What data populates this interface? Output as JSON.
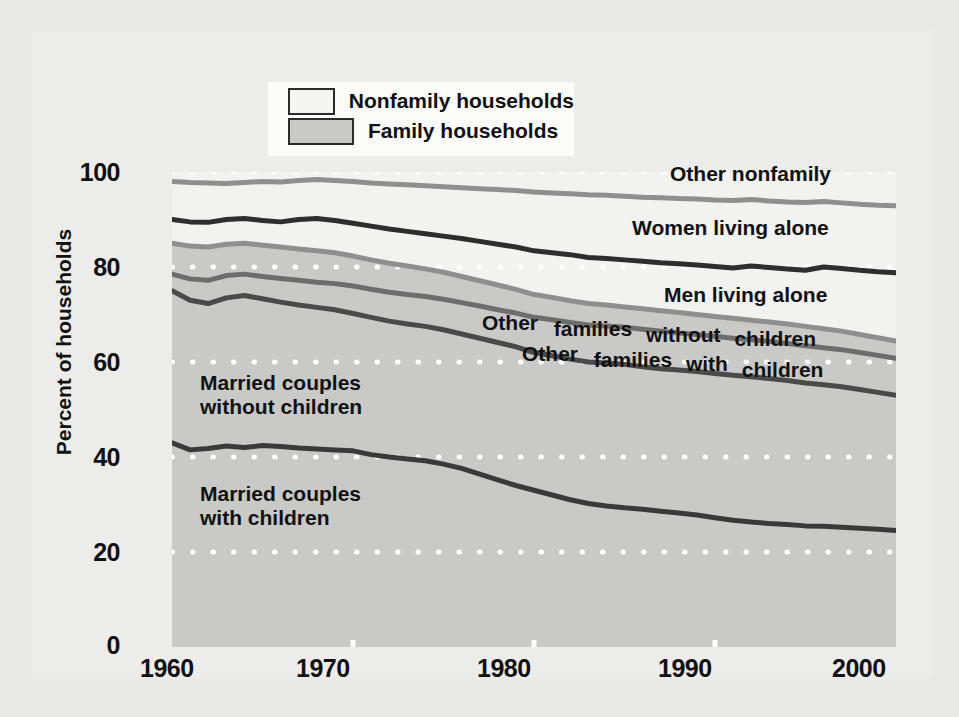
{
  "legend": {
    "items": [
      {
        "label": "Nonfamily households",
        "swatch": "#f5f5f4",
        "name": "nonfamily"
      },
      {
        "label": "Family households",
        "swatch": "#c9c9c7",
        "name": "family"
      }
    ]
  },
  "axes": {
    "ylabel": "Percent of households",
    "yticks": [
      "0",
      "20",
      "40",
      "60",
      "80",
      "100"
    ],
    "xticks": [
      "1960",
      "1970",
      "1980",
      "1990",
      "2000"
    ]
  },
  "series_labels": [
    {
      "name": "other-nonfamily",
      "text": "Other nonfamily"
    },
    {
      "name": "women-living-alone",
      "text": "Women living alone"
    },
    {
      "name": "men-living-alone",
      "text": "Men living alone"
    },
    {
      "name": "other-families-without-children",
      "text": "Other families without children"
    },
    {
      "name": "other-families-with-children",
      "text": "Other families with children"
    },
    {
      "name": "married-couples-without-children",
      "text": "Married couples without children"
    },
    {
      "name": "married-couples-with-children",
      "text": "Married couples with children"
    }
  ],
  "chart_data": {
    "type": "area",
    "title": "",
    "xlabel": "",
    "ylabel": "Percent of households",
    "xlim": [
      1960,
      2000
    ],
    "ylim": [
      0,
      100
    ],
    "grid": "dotted-white-horizontal",
    "stacked": true,
    "note": "Cumulative (stacked) boundary lines; top of stack is 100 percent of households. Family households shaded gray, nonfamily households unshaded.",
    "x": [
      1960,
      1961,
      1962,
      1963,
      1964,
      1965,
      1966,
      1967,
      1968,
      1969,
      1970,
      1971,
      1972,
      1973,
      1974,
      1975,
      1976,
      1977,
      1978,
      1979,
      1980,
      1981,
      1982,
      1983,
      1984,
      1985,
      1986,
      1987,
      1988,
      1989,
      1990,
      1991,
      1992,
      1993,
      1994,
      1995,
      1996,
      1997,
      1998,
      1999,
      2000
    ],
    "boundaries": [
      {
        "name": "Married couples with children",
        "line_color": "#3a3a3a",
        "fill_color": "#c9c9c7",
        "cumulative_values": [
          43.0,
          41.5,
          41.8,
          42.3,
          42.0,
          42.4,
          42.2,
          41.9,
          41.7,
          41.5,
          41.3,
          40.5,
          40.0,
          39.6,
          39.2,
          38.5,
          37.6,
          36.4,
          35.2,
          34.0,
          33.0,
          32.0,
          31.0,
          30.2,
          29.7,
          29.3,
          29.0,
          28.6,
          28.2,
          27.8,
          27.2,
          26.7,
          26.3,
          26.0,
          25.8,
          25.5,
          25.4,
          25.2,
          25.0,
          24.8,
          24.5
        ]
      },
      {
        "name": "Married couples without children",
        "line_color": "#4a4a4a",
        "fill_color": "#c9c9c7",
        "cumulative_values": [
          75.0,
          73.0,
          72.3,
          73.5,
          74.0,
          73.3,
          72.6,
          72.0,
          71.5,
          71.0,
          70.2,
          69.4,
          68.6,
          68.0,
          67.5,
          66.8,
          65.9,
          65.0,
          64.1,
          63.2,
          62.0,
          61.3,
          60.6,
          60.0,
          59.8,
          59.5,
          59.0,
          58.6,
          58.3,
          58.0,
          57.6,
          57.2,
          56.9,
          56.5,
          56.1,
          55.6,
          55.2,
          54.8,
          54.2,
          53.6,
          53.0
        ]
      },
      {
        "name": "Other families with children",
        "line_color": "#6d6d6d",
        "fill_color": "#c9c9c7",
        "cumulative_values": [
          78.5,
          77.5,
          77.2,
          78.2,
          78.5,
          78.0,
          77.6,
          77.2,
          76.8,
          76.5,
          76.0,
          75.3,
          74.7,
          74.2,
          73.8,
          73.2,
          72.5,
          71.8,
          71.0,
          70.3,
          69.4,
          68.9,
          68.3,
          67.8,
          67.6,
          67.3,
          66.9,
          66.5,
          66.1,
          65.8,
          65.4,
          65.0,
          64.7,
          64.3,
          63.9,
          63.4,
          63.0,
          62.6,
          62.0,
          61.4,
          60.8
        ]
      },
      {
        "name": "Other families without children",
        "line_color": "#8f8f8f",
        "fill_color": "#dcdcda",
        "cumulative_values": [
          85.0,
          84.4,
          84.2,
          84.8,
          85.0,
          84.6,
          84.2,
          83.8,
          83.4,
          83.0,
          82.3,
          81.5,
          80.8,
          80.2,
          79.6,
          78.9,
          78.0,
          77.1,
          76.2,
          75.3,
          74.2,
          73.6,
          72.9,
          72.3,
          72.0,
          71.6,
          71.2,
          70.8,
          70.4,
          70.0,
          69.6,
          69.2,
          68.8,
          68.4,
          68.0,
          67.5,
          67.0,
          66.5,
          65.8,
          65.1,
          64.4
        ]
      },
      {
        "name": "Men living alone",
        "line_color": "#2e2e2e",
        "fill_color": "#f2f2f1",
        "cumulative_values": [
          90.0,
          89.5,
          89.4,
          90.0,
          90.2,
          89.8,
          89.5,
          90.0,
          90.2,
          89.8,
          89.2,
          88.6,
          88.0,
          87.5,
          87.0,
          86.5,
          86.0,
          85.4,
          84.8,
          84.2,
          83.4,
          83.0,
          82.6,
          82.0,
          81.8,
          81.5,
          81.2,
          80.9,
          80.7,
          80.4,
          80.1,
          79.8,
          80.2,
          79.9,
          79.6,
          79.3,
          80.0,
          79.7,
          79.3,
          79.0,
          78.8
        ]
      },
      {
        "name": "Women living alone",
        "line_color": "#8f8f8f",
        "fill_color": "#f2f2f1",
        "cumulative_values": [
          98.0,
          97.8,
          97.7,
          97.6,
          97.8,
          98.0,
          97.9,
          98.2,
          98.4,
          98.2,
          98.0,
          97.7,
          97.5,
          97.3,
          97.1,
          96.9,
          96.7,
          96.5,
          96.3,
          96.1,
          95.8,
          95.6,
          95.4,
          95.2,
          95.1,
          94.9,
          94.7,
          94.6,
          94.4,
          94.3,
          94.1,
          94.0,
          94.2,
          93.9,
          93.7,
          93.6,
          93.8,
          93.5,
          93.2,
          93.0,
          92.9
        ]
      },
      {
        "name": "Other nonfamily",
        "line_color": "none",
        "fill_color": "#f2f2f1",
        "cumulative_values": [
          100,
          100,
          100,
          100,
          100,
          100,
          100,
          100,
          100,
          100,
          100,
          100,
          100,
          100,
          100,
          100,
          100,
          100,
          100,
          100,
          100,
          100,
          100,
          100,
          100,
          100,
          100,
          100,
          100,
          100,
          100,
          100,
          100,
          100,
          100,
          100,
          100,
          100,
          100,
          100,
          100
        ]
      }
    ]
  }
}
